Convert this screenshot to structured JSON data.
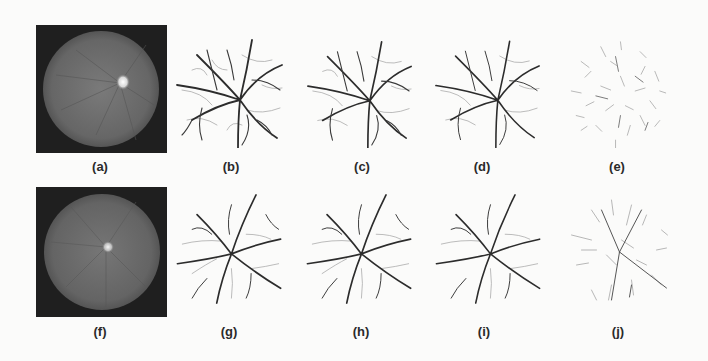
{
  "figure": {
    "rows": [
      {
        "panels": [
          {
            "id": "a",
            "label": "(a)",
            "type": "fundus-image"
          },
          {
            "id": "b",
            "label": "(b)",
            "type": "vessel-segmentation"
          },
          {
            "id": "c",
            "label": "(c)",
            "type": "vessel-segmentation"
          },
          {
            "id": "d",
            "label": "(d)",
            "type": "vessel-segmentation"
          },
          {
            "id": "e",
            "label": "(e)",
            "type": "vessel-segmentation-faint"
          }
        ]
      },
      {
        "panels": [
          {
            "id": "f",
            "label": "(f)",
            "type": "fundus-image"
          },
          {
            "id": "g",
            "label": "(g)",
            "type": "vessel-segmentation"
          },
          {
            "id": "h",
            "label": "(h)",
            "type": "vessel-segmentation"
          },
          {
            "id": "i",
            "label": "(i)",
            "type": "vessel-segmentation"
          },
          {
            "id": "j",
            "label": "(j)",
            "type": "vessel-segmentation-faint"
          }
        ]
      }
    ],
    "colors": {
      "background": "#fbfbfa",
      "fundus_frame": "#1f1f1f",
      "fundus_disc": "#6e6e6e",
      "optic_disc": "#f2f2f2",
      "vessel_dark": "#2c2c2c",
      "vessel_light": "#9a9a9a",
      "label": "#2a2a2a"
    }
  }
}
